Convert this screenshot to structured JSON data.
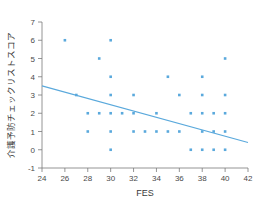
{
  "chart_data": {
    "type": "scatter",
    "title": "",
    "xlabel": "FES",
    "ylabel": "介護予防チェックリストスコア",
    "xlim": [
      24,
      42
    ],
    "ylim": [
      -1,
      7
    ],
    "xticks": [
      24,
      26,
      28,
      30,
      32,
      34,
      36,
      38,
      40,
      42
    ],
    "xtick_labels": [
      "24",
      "26",
      "28",
      "30",
      "32",
      "34",
      "36",
      "38",
      "40",
      "42"
    ],
    "yticks": [
      -1,
      0,
      1,
      2,
      3,
      4,
      5,
      6,
      7
    ],
    "ytick_labels": [
      "-1",
      "0",
      "1",
      "2",
      "3",
      "4",
      "5",
      "6",
      "7"
    ],
    "grid": false,
    "legend": null,
    "marker_color": "#5aa9dc",
    "line_color": "#5aa9dc",
    "series": [
      {
        "name": "points",
        "type": "scatter",
        "marker": "square",
        "color": "#5aa9dc",
        "points": [
          [
            26,
            6
          ],
          [
            29,
            5
          ],
          [
            30,
            6
          ],
          [
            30,
            4
          ],
          [
            30,
            3
          ],
          [
            30,
            2
          ],
          [
            30,
            1
          ],
          [
            30,
            0
          ],
          [
            27,
            3
          ],
          [
            28,
            2
          ],
          [
            28,
            1
          ],
          [
            29,
            2
          ],
          [
            31,
            2
          ],
          [
            32,
            3
          ],
          [
            32,
            2
          ],
          [
            32,
            1
          ],
          [
            33,
            1
          ],
          [
            34,
            2
          ],
          [
            34,
            1
          ],
          [
            35,
            4
          ],
          [
            35,
            1
          ],
          [
            36,
            3
          ],
          [
            36,
            1
          ],
          [
            37,
            2
          ],
          [
            37,
            0
          ],
          [
            38,
            4
          ],
          [
            38,
            3
          ],
          [
            38,
            2
          ],
          [
            38,
            1
          ],
          [
            38,
            0
          ],
          [
            39,
            2
          ],
          [
            39,
            1
          ],
          [
            39,
            0
          ],
          [
            40,
            5
          ],
          [
            40,
            3
          ],
          [
            40,
            2
          ],
          [
            40,
            1
          ],
          [
            40,
            0
          ]
        ]
      },
      {
        "name": "regression-line",
        "type": "line",
        "color": "#5aa9dc",
        "x": [
          24,
          42
        ],
        "y": [
          3.5,
          0.4
        ]
      }
    ]
  },
  "axes": {
    "x_title": "FES",
    "y_title": "介護予防チェックリストスコア"
  }
}
